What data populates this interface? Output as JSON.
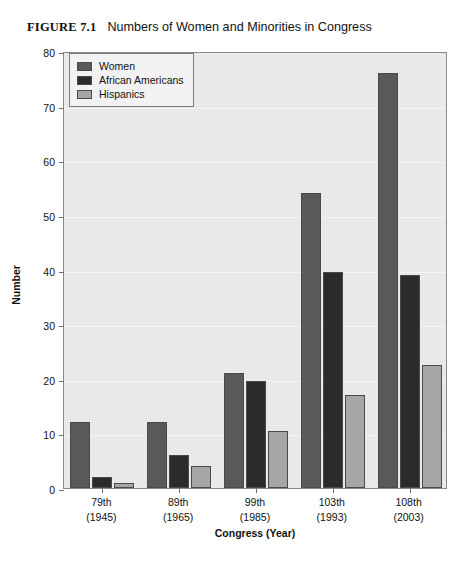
{
  "figure": {
    "label": "FIGURE 7.1",
    "title": "Numbers of Women and Minorities in Congress"
  },
  "legend": {
    "position": "top-left",
    "items": [
      {
        "label": "Women",
        "color": "#595959"
      },
      {
        "label": "African Americans",
        "color": "#2b2b2b"
      },
      {
        "label": "Hispanics",
        "color": "#a6a6a6"
      }
    ]
  },
  "axes": {
    "y_title": "Number",
    "x_title": "Congress (Year)",
    "y_ticks": [
      "0",
      "10",
      "20",
      "30",
      "40",
      "50",
      "60",
      "70",
      "80"
    ]
  },
  "chart_data": {
    "type": "bar",
    "title": "Numbers of Women and Minorities in Congress",
    "xlabel": "Congress (Year)",
    "ylabel": "Number",
    "ylim": [
      0,
      80
    ],
    "ytick_step": 10,
    "grid": true,
    "legend_position": "upper left",
    "categories": [
      "79th\n(1945)",
      "89th\n(1965)",
      "99th\n(1985)",
      "103th\n(1993)",
      "108th\n(2003)"
    ],
    "category_lines": [
      {
        "congress": "79th",
        "year": "(1945)"
      },
      {
        "congress": "89th",
        "year": "(1965)"
      },
      {
        "congress": "99th",
        "year": "(1985)"
      },
      {
        "congress": "103th",
        "year": "(1993)"
      },
      {
        "congress": "108th",
        "year": "(2003)"
      }
    ],
    "series": [
      {
        "name": "Women",
        "color": "#595959",
        "values": [
          12,
          12,
          21,
          54,
          76
        ]
      },
      {
        "name": "African Americans",
        "color": "#2b2b2b",
        "values": [
          2,
          6,
          19.5,
          39.5,
          39
        ]
      },
      {
        "name": "Hispanics",
        "color": "#a6a6a6",
        "values": [
          1,
          4,
          10.5,
          17,
          22.5
        ]
      }
    ]
  }
}
